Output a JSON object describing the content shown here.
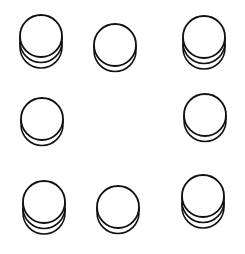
{
  "diagram": {
    "stroke_color": "#111111",
    "background": "#ffffff",
    "coin_radius": 21,
    "layer_offset": 5.5,
    "stacks": [
      {
        "position": "top-left",
        "cx": 41,
        "cy": 36,
        "coins": 3
      },
      {
        "position": "top-center",
        "cx": 115,
        "cy": 45,
        "coins": 2
      },
      {
        "position": "top-right",
        "cx": 204,
        "cy": 37,
        "coins": 3
      },
      {
        "position": "middle-left",
        "cx": 42,
        "cy": 119,
        "coins": 2
      },
      {
        "position": "middle-right",
        "cx": 205,
        "cy": 115,
        "coins": 2
      },
      {
        "position": "bottom-left",
        "cx": 44,
        "cy": 202,
        "coins": 3
      },
      {
        "position": "bottom-center",
        "cx": 118,
        "cy": 207,
        "coins": 2
      },
      {
        "position": "bottom-right",
        "cx": 203,
        "cy": 196,
        "coins": 3
      }
    ]
  }
}
